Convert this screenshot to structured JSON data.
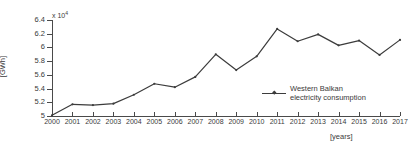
{
  "chart_data": {
    "type": "line",
    "title": "",
    "xlabel": "[years]",
    "ylabel": "[GWh]",
    "y_exponent_label": "x 10",
    "y_exponent_power": "4",
    "y_scale_factor": 10000,
    "grid": false,
    "legend_position": "center-right",
    "xlim": [
      2000,
      2017
    ],
    "ylim": [
      50000,
      64000
    ],
    "ytick_labels": [
      "6.4",
      "6.2",
      "6",
      "5.8",
      "5.6",
      "5.4",
      "5.2",
      "5"
    ],
    "ytick_values": [
      64000,
      62000,
      60000,
      58000,
      56000,
      54000,
      52000,
      50000
    ],
    "categories": [
      "2000",
      "2001",
      "2002",
      "2003",
      "2004",
      "2005",
      "2006",
      "2007",
      "2008",
      "2009",
      "2010",
      "2011",
      "2012",
      "2013",
      "2014",
      "2015",
      "2016",
      "2017"
    ],
    "x": [
      2000,
      2001,
      2002,
      2003,
      2004,
      2005,
      2006,
      2007,
      2008,
      2009,
      2010,
      2011,
      2012,
      2013,
      2014,
      2015,
      2016,
      2017
    ],
    "series": [
      {
        "name": "Western Balkan electricity consumption",
        "marker": "point",
        "color": "#3c3c3c",
        "values": [
          50100,
          51700,
          51600,
          51800,
          53100,
          54700,
          54200,
          55700,
          59000,
          56700,
          58700,
          62700,
          60900,
          61900,
          60300,
          61000,
          58900,
          61100
        ]
      }
    ]
  },
  "legend": {
    "entries": [
      {
        "line1": "Western Balkan",
        "line2": "electricity consumption"
      }
    ]
  }
}
